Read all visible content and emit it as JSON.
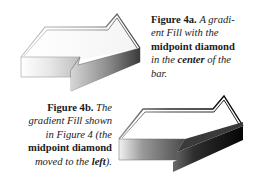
{
  "figure_a": {
    "label": "Figure 4a.",
    "caption_parts": [
      {
        "text": "A gradi-",
        "style": "italic"
      },
      {
        "text": "ent Fill with the",
        "style": "italic"
      },
      {
        "text": "midpoint diamond",
        "style": "bold"
      },
      {
        "text": "in the ",
        "style": "italic"
      },
      {
        "text": "center",
        "style": "bold-italic"
      },
      {
        "text": " of the",
        "style": "italic"
      },
      {
        "text": "bar.",
        "style": "italic"
      }
    ],
    "gradient": {
      "light": "#ffffff",
      "mid": "#d0d0d0",
      "dark": "#404040"
    }
  },
  "figure_b": {
    "label": "Figure 4b.",
    "caption_parts": [
      {
        "text": "The",
        "style": "italic"
      },
      {
        "text": "gradient Fill shown",
        "style": "italic"
      },
      {
        "text": "in Figure 4 (the",
        "style": "italic"
      },
      {
        "text": "midpoint diamond",
        "style": "bold"
      },
      {
        "text": "moved to the ",
        "style": "italic"
      },
      {
        "text": "left",
        "style": "bold-italic"
      },
      {
        "text": ").",
        "style": "italic"
      }
    ],
    "gradient": {
      "light": "#f0f0f0",
      "mid": "#707070",
      "dark": "#0a0a0a"
    }
  }
}
